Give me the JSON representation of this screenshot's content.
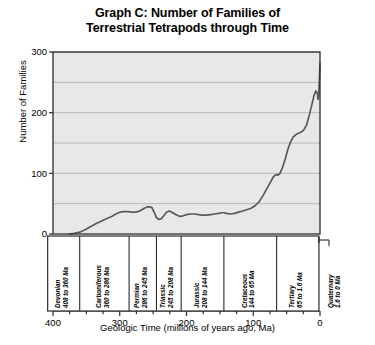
{
  "chart": {
    "title_line1": "Graph C: Number of Families of",
    "title_line2": "Terrestrial Tetrapods through Time",
    "ylabel": "Number of Families",
    "xlabel": "Geologic Time (millions of years ago, Ma)",
    "ytick_labels": [
      "0",
      "100",
      "200",
      "300"
    ],
    "xtick_labels": [
      "400",
      "300",
      "200",
      "100",
      "0"
    ],
    "plot_bg": "#e8e8e8",
    "line_color": "#5a5a5a",
    "frame_color": "#2b2b2b",
    "grid_color": "#b4b4b4"
  },
  "periods": [
    {
      "name": "Devonian",
      "range": "408 to 360 Ma",
      "start": 408,
      "end": 360,
      "inside": true
    },
    {
      "name": "Carboniferous",
      "range": "360 to 286 Ma",
      "start": 360,
      "end": 286,
      "inside": true
    },
    {
      "name": "Permian",
      "range": "286 to 245 Ma",
      "start": 286,
      "end": 245,
      "inside": true
    },
    {
      "name": "Triassic",
      "range": "245 to 208 Ma",
      "start": 245,
      "end": 208,
      "inside": true
    },
    {
      "name": "Jurassic",
      "range": "208 to 144 Ma",
      "start": 208,
      "end": 144,
      "inside": true
    },
    {
      "name": "Cretaceous",
      "range": "144 to 65 Ma",
      "start": 144,
      "end": 65,
      "inside": true
    },
    {
      "name": "Tertiary",
      "range": "65 to 1.6 Ma",
      "start": 65,
      "end": 1.6,
      "inside": true
    },
    {
      "name": "Quaternary",
      "range": "1.6 to 0 Ma",
      "start": 1.6,
      "end": 0,
      "inside": false
    }
  ],
  "chart_data": {
    "type": "line",
    "title": "Graph C: Number of Families of Terrestrial Tetrapods through Time",
    "xlabel": "Geologic Time (millions of years ago, Ma)",
    "ylabel": "Number of Families",
    "xlim": [
      400,
      0
    ],
    "ylim": [
      0,
      300
    ],
    "x_axis_reversed": true,
    "xticks": [
      400,
      300,
      200,
      100,
      0
    ],
    "xminor_tick_step": 25,
    "yticks": [
      0,
      100,
      200,
      300
    ],
    "ygrid_step": 50,
    "grid": true,
    "legend": "none",
    "series": [
      {
        "name": "Terrestrial tetrapod families",
        "x": [
          375,
          368,
          360,
          352,
          344,
          336,
          328,
          320,
          312,
          306,
          300,
          294,
          288,
          282,
          276,
          270,
          264,
          258,
          252,
          248,
          245,
          242,
          238,
          234,
          230,
          226,
          222,
          216,
          210,
          205,
          200,
          194,
          188,
          182,
          176,
          170,
          164,
          158,
          152,
          146,
          144,
          140,
          134,
          128,
          122,
          116,
          110,
          104,
          98,
          92,
          86,
          80,
          74,
          70,
          67,
          65,
          63,
          60,
          56,
          52,
          48,
          44,
          40,
          36,
          32,
          28,
          24,
          20,
          16,
          12,
          9,
          6,
          4,
          3,
          2,
          1.5,
          1,
          0.5,
          0
        ],
        "y": [
          0,
          1,
          3,
          7,
          12,
          17,
          21,
          25,
          29,
          33,
          36,
          37,
          37,
          36,
          36,
          38,
          42,
          45,
          44,
          35,
          27,
          24,
          25,
          30,
          36,
          38,
          36,
          32,
          29,
          30,
          32,
          33,
          33,
          32,
          31,
          31,
          32,
          33,
          34,
          35,
          35,
          34,
          33,
          34,
          36,
          38,
          40,
          42,
          46,
          52,
          62,
          74,
          86,
          94,
          97,
          98,
          97,
          100,
          110,
          124,
          140,
          152,
          160,
          164,
          166,
          168,
          172,
          180,
          196,
          214,
          228,
          236,
          232,
          222,
          228,
          240,
          252,
          266,
          281
        ]
      }
    ],
    "annotations": [
      "Curve begins near zero at about 375 Ma in the Devonian",
      "Rises to about 37 families by the end of the Carboniferous",
      "Permian peak of about 45 families near 258 Ma",
      "Permian-Triassic drop to about 24 families near 242 Ma",
      "Triassic recovery to about 38 families near 226 Ma",
      "Plateau near 30-35 families through the Jurassic",
      "Steady Cretaceous rise to about 98 families by 65 Ma",
      "Steep Tertiary climb to about 236 families near 6 Ma",
      "Late Pleistocene dip to about 222 families",
      "Final value about 281 families at 0 Ma"
    ]
  }
}
